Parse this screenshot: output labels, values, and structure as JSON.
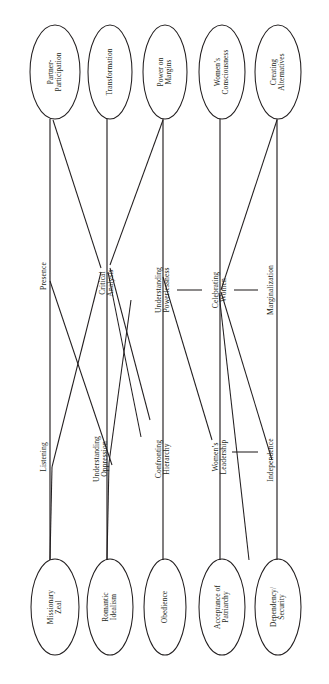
{
  "diagram": {
    "orientation": "rotated-90",
    "stroke_color": "#231f20",
    "background_color": "#ffffff",
    "top_nodes": [
      {
        "id": "partner-participation",
        "label": "Partner-\nParticipation"
      },
      {
        "id": "transformation",
        "label": "Transformation"
      },
      {
        "id": "power-on-margins",
        "label": "Power on\nMargins"
      },
      {
        "id": "womens-consciousness",
        "label": "Women’s\nConsciousness"
      },
      {
        "id": "creating-alternatives",
        "label": "Creating\nAlternatives"
      }
    ],
    "bottom_nodes": [
      {
        "id": "missionary-zeal",
        "label": "Missionary\nZeal"
      },
      {
        "id": "romantic-idealism",
        "label": "Romantic\nIdealism"
      },
      {
        "id": "obedience",
        "label": "Obedience"
      },
      {
        "id": "acceptance-of-patriarchy",
        "label": "Acceptance of\nPatriarchy"
      },
      {
        "id": "dependency-security",
        "label": "Dependency/\nSecurity"
      }
    ],
    "upper_axis_labels": [
      {
        "id": "presence",
        "label": "Presence"
      },
      {
        "id": "critical-analysis",
        "label": "Critical\nAnalysis"
      },
      {
        "id": "understanding-powerlessness",
        "label": "Understanding\nPowerlessness"
      },
      {
        "id": "celebrating-women",
        "label": "Celebrating\nWomen"
      },
      {
        "id": "marginalization",
        "label": "Marginalization"
      }
    ],
    "lower_axis_labels": [
      {
        "id": "listening",
        "label": "Listening"
      },
      {
        "id": "understanding-oppression",
        "label": "Understanding\nOppression"
      },
      {
        "id": "confronting-hierarchy",
        "label": "Confronting\nHierarchy"
      },
      {
        "id": "womens-leadership",
        "label": "Women’s\nLeadership"
      },
      {
        "id": "independence",
        "label": "Independence"
      }
    ]
  }
}
